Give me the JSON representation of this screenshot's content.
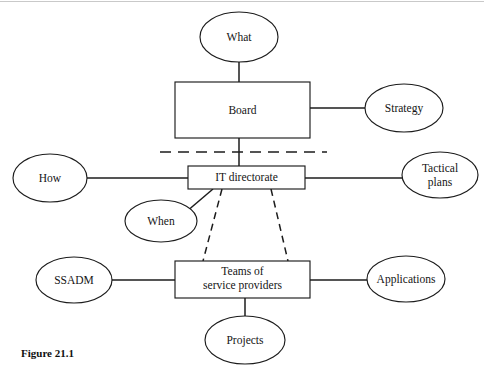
{
  "figure": {
    "caption": "Figure 21.1",
    "background_color": "#ffffff",
    "line_color": "#1c1c1c",
    "text_color": "#141414"
  },
  "nodes": {
    "what": {
      "label": "What",
      "shape": "ellipse",
      "cx": 239,
      "cy": 37,
      "rx": 39,
      "ry": 25
    },
    "board": {
      "label": "Board",
      "shape": "rect",
      "x": 175,
      "y": 82,
      "w": 135,
      "h": 56
    },
    "strategy": {
      "label": "Strategy",
      "shape": "ellipse",
      "cx": 404,
      "cy": 108,
      "rx": 39,
      "ry": 24
    },
    "how": {
      "label": "How",
      "shape": "ellipse",
      "cx": 50,
      "cy": 178,
      "rx": 37,
      "ry": 24
    },
    "it_directorate": {
      "label": "IT directorate",
      "shape": "rect",
      "x": 188,
      "y": 166,
      "w": 117,
      "h": 23
    },
    "tactical_plans": {
      "label_line1": "Tactical",
      "label_line2": "plans",
      "shape": "ellipse",
      "cx": 440,
      "cy": 175,
      "rx": 38,
      "ry": 23
    },
    "when": {
      "label": "When",
      "shape": "ellipse",
      "cx": 161,
      "cy": 221,
      "rx": 36,
      "ry": 21
    },
    "ssadm": {
      "label": "SSADM",
      "shape": "ellipse",
      "cx": 74,
      "cy": 280,
      "rx": 38,
      "ry": 23
    },
    "teams": {
      "label_line1": "Teams of",
      "label_line2": "service providers",
      "shape": "rect",
      "x": 175,
      "y": 261,
      "w": 135,
      "h": 37
    },
    "applications": {
      "label": "Applications",
      "shape": "ellipse",
      "cx": 406,
      "cy": 279,
      "rx": 39,
      "ry": 23
    },
    "projects": {
      "label": "Projects",
      "shape": "ellipse",
      "cx": 245,
      "cy": 340,
      "rx": 40,
      "ry": 24
    }
  },
  "edges": [
    {
      "name": "what-to-board",
      "style": "solid",
      "from": "what",
      "to": "board"
    },
    {
      "name": "board-to-strategy",
      "style": "solid",
      "from": "board",
      "to": "strategy"
    },
    {
      "name": "board-to-it-directorate",
      "style": "solid",
      "from": "board",
      "to": "it_directorate"
    },
    {
      "name": "how-to-it-directorate",
      "style": "solid",
      "from": "how",
      "to": "it_directorate"
    },
    {
      "name": "it-directorate-to-tactical-plans",
      "style": "solid",
      "from": "it_directorate",
      "to": "tactical_plans"
    },
    {
      "name": "it-directorate-to-when",
      "style": "solid",
      "from": "it_directorate",
      "to": "when"
    },
    {
      "name": "it-directorate-to-teams-left",
      "style": "dashed",
      "from": "it_directorate",
      "to": "teams"
    },
    {
      "name": "it-directorate-to-teams-right",
      "style": "dashed",
      "from": "it_directorate",
      "to": "teams"
    },
    {
      "name": "ssadm-to-teams",
      "style": "solid",
      "from": "ssadm",
      "to": "teams"
    },
    {
      "name": "teams-to-applications",
      "style": "solid",
      "from": "teams",
      "to": "applications"
    },
    {
      "name": "teams-to-projects",
      "style": "solid",
      "from": "teams",
      "to": "projects"
    }
  ],
  "divider": {
    "name": "governance-divider",
    "style": "dashed",
    "x1": 160,
    "x2": 327,
    "y": 152
  }
}
